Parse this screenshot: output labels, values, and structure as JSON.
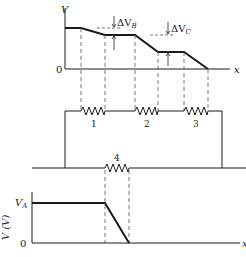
{
  "top_graph": {
    "y_label": "V",
    "x_label": "x",
    "origin_label": "0",
    "delta_b_label": "ΔV",
    "delta_b_sub": "B",
    "delta_c_label": "ΔV",
    "delta_c_sub": "C"
  },
  "circuit": {
    "resistors": [
      {
        "label": "1"
      },
      {
        "label": "2"
      },
      {
        "label": "3"
      },
      {
        "label": "4"
      }
    ]
  },
  "bottom_graph": {
    "y_label": "V (V)",
    "y_value_label": "V",
    "y_value_sub": "A",
    "origin_label": "0",
    "x_label": "x"
  },
  "colors": {
    "line": "#1a1a1a",
    "dashed": "#555555"
  }
}
